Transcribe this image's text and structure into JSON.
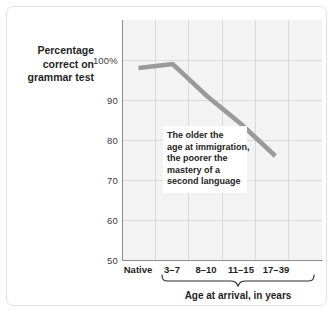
{
  "chart_data": {
    "type": "line",
    "title": "",
    "xlabel": "Age at arrival, in years",
    "ylabel": "Percentage correct on grammar test",
    "ylabel_lines": [
      "Percentage",
      "correct on",
      "grammar test"
    ],
    "categories": [
      "Native",
      "3–7",
      "8–10",
      "11–15",
      "17–39"
    ],
    "values": [
      98,
      99,
      91,
      84,
      76
    ],
    "ylim": [
      50,
      100
    ],
    "yticks": [
      100,
      90,
      80,
      70,
      60,
      50
    ],
    "ytick_labels": [
      "100%",
      "90",
      "80",
      "70",
      "60",
      "50"
    ],
    "grid": true,
    "legend": "none",
    "line_color": "#9a9a9a",
    "plot_background": "#f3f3f3",
    "grid_color": "#dadada",
    "annotation": {
      "lines": [
        "The older the",
        "age at immigration,",
        "the poorer the",
        "mastery of a",
        "second language"
      ]
    },
    "brace": {
      "label": "Age at arrival, in years",
      "spans": [
        "3–7",
        "8–10",
        "11–15",
        "17–39"
      ]
    }
  }
}
